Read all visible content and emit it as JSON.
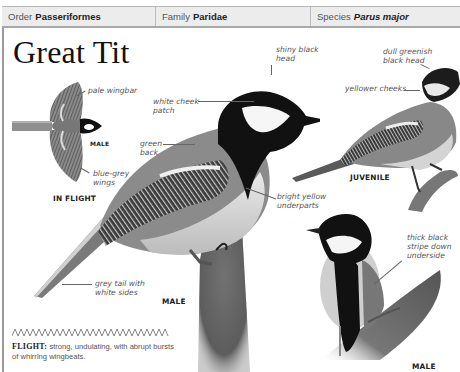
{
  "header": {
    "order_label": "Order",
    "order_value": "Passeriformes",
    "family_label": "Family",
    "family_value": "Paridae",
    "species_label": "Species",
    "species_value": "Parus major"
  },
  "title": "Great Tit",
  "in_flight": {
    "caption": "IN FLIGHT",
    "sex_label": "MALE",
    "labels": [
      "pale wingbar",
      "blue-grey wings"
    ]
  },
  "main_male": {
    "caption": "MALE",
    "labels": {
      "head": "shiny black head",
      "cheek": "white cheek patch",
      "back": "green back",
      "underparts": "bright yellow underparts",
      "tail": "grey tail with white sides"
    }
  },
  "juvenile": {
    "caption": "JUVENILE",
    "labels": {
      "head": "dull greenish black head",
      "cheeks": "yellower cheeks"
    }
  },
  "front_male": {
    "caption": "MALE",
    "labels": {
      "stripe": "thick black stripe down underside"
    }
  },
  "flight": {
    "heading": "FLIGHT:",
    "text": "strong, undulating, with abrupt bursts of whirring wingbeats."
  },
  "colors": {
    "header_bg": "#ececec",
    "header_border": "#a8a8a8",
    "text": "#222222",
    "label": "#555555"
  }
}
